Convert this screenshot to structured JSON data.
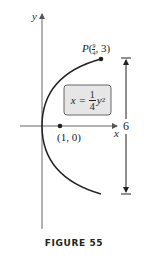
{
  "figure": {
    "caption": "FIGURE 55",
    "axes": {
      "x_label": "x",
      "y_label": "y"
    },
    "curve": {
      "equation_lhs": "x =",
      "equation_num": "1",
      "equation_den": "4",
      "equation_var": "y",
      "equation_exp": "2"
    },
    "points": {
      "P": {
        "name": "P",
        "label_open": "(",
        "x_num": "9",
        "x_den": "4",
        "label_rest": ", 3)"
      },
      "focus": {
        "label": "(1, 0)"
      }
    },
    "dimension": {
      "label": "6"
    },
    "colors": {
      "stroke": "#231f20",
      "axis": "#555555",
      "box_fill": "#e6e6e6",
      "box_stroke": "#444444"
    }
  }
}
